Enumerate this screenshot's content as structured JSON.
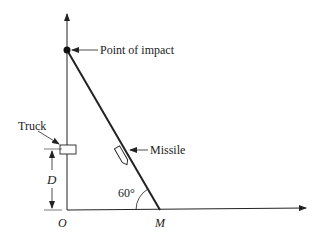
{
  "labels": {
    "impact": "Point of impact",
    "truck": "Truck",
    "missile": "Missile",
    "distance": "D",
    "angle": "60°",
    "origin": "O",
    "launch_point": "M"
  }
}
